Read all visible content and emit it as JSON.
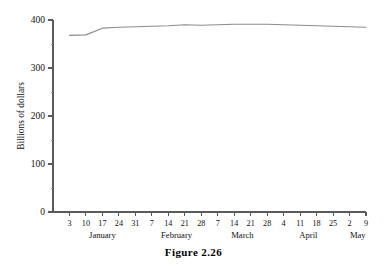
{
  "figure": {
    "caption": "Figure 2.26"
  },
  "chart_data": {
    "type": "line",
    "title": "",
    "xlabel": "",
    "ylabel": "Billions of dollars",
    "ylim": [
      0,
      400
    ],
    "yticks": [
      0,
      100,
      200,
      300,
      400
    ],
    "ytick_labels": [
      "0",
      "100",
      "200",
      "300",
      "400"
    ],
    "yminor_ticks": [
      50,
      150,
      250,
      350
    ],
    "grid": false,
    "legend": false,
    "line_color": "#8d8d8d",
    "axis_color": "#5a5a5a",
    "x": [
      "Jan 3",
      "Jan 10",
      "Jan 17",
      "Jan 24",
      "Jan 31",
      "Feb 7",
      "Feb 14",
      "Feb 21",
      "Feb 28",
      "Mar 7",
      "Mar 14",
      "Mar 21",
      "Mar 28",
      "Apr 4",
      "Apr 11",
      "Apr 18",
      "Apr 25",
      "May 2",
      "May 9"
    ],
    "xtick_labels": [
      "3",
      "10",
      "17",
      "24",
      "31",
      "7",
      "14",
      "21",
      "28",
      "7",
      "14",
      "21",
      "28",
      "4",
      "11",
      "18",
      "25",
      "2",
      "9"
    ],
    "month_groups": [
      {
        "label": "January",
        "start_index": 0,
        "end_index": 4
      },
      {
        "label": "February",
        "start_index": 5,
        "end_index": 8
      },
      {
        "label": "March",
        "start_index": 9,
        "end_index": 12
      },
      {
        "label": "April",
        "start_index": 13,
        "end_index": 16
      },
      {
        "label": "May",
        "start_index": 17,
        "end_index": 18
      }
    ],
    "values": [
      368,
      369,
      383,
      385,
      386,
      387,
      388,
      390,
      389,
      390,
      391,
      391,
      391,
      390,
      389,
      388,
      387,
      386,
      385
    ],
    "units": "Billions of dollars"
  }
}
